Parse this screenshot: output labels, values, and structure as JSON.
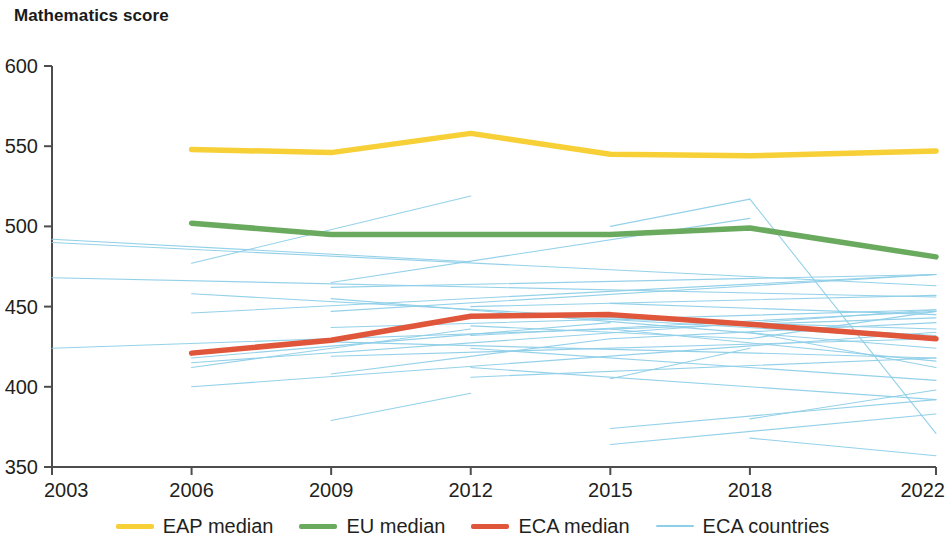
{
  "chart": {
    "title": "Mathematics score"
  },
  "legend": {
    "items": [
      {
        "label": "EAP median",
        "color": "#f7cf36",
        "width": "thick"
      },
      {
        "label": "EU median",
        "color": "#6aaa5f",
        "width": "thick"
      },
      {
        "label": "ECA median",
        "color": "#e0563a",
        "width": "thick"
      },
      {
        "label": "ECA countries",
        "color": "#8ecfe8",
        "width": "thin"
      }
    ]
  },
  "chart_data": {
    "type": "line",
    "title": "Mathematics score",
    "xlabel": "",
    "ylabel": "Mathematics score",
    "xlim": [
      2003,
      2022
    ],
    "ylim": [
      350,
      600
    ],
    "xticks": [
      2003,
      2006,
      2009,
      2012,
      2015,
      2018,
      2022
    ],
    "yticks": [
      350,
      400,
      450,
      500,
      550,
      600
    ],
    "grid": false,
    "legend_position": "bottom",
    "series": [
      {
        "name": "EAP median",
        "color": "#f7cf36",
        "x": [
          2006,
          2009,
          2012,
          2015,
          2018,
          2022
        ],
        "values": [
          548,
          546,
          558,
          545,
          544,
          547
        ]
      },
      {
        "name": "EU median",
        "color": "#6aaa5f",
        "x": [
          2006,
          2009,
          2012,
          2015,
          2018,
          2022
        ],
        "values": [
          502,
          495,
          495,
          495,
          499,
          481
        ]
      },
      {
        "name": "ECA median",
        "color": "#e0563a",
        "x": [
          2006,
          2009,
          2012,
          2015,
          2018,
          2022
        ],
        "values": [
          421,
          429,
          444,
          445,
          439,
          430
        ]
      }
    ],
    "background_series": {
      "name": "ECA countries",
      "color": "#8ecfe8",
      "lines": [
        {
          "x": [
            2003,
            2022
          ],
          "values": [
            490,
            463
          ]
        },
        {
          "x": [
            2003,
            2022
          ],
          "values": [
            468,
            456
          ]
        },
        {
          "x": [
            2003,
            2022
          ],
          "values": [
            424,
            443
          ]
        },
        {
          "x": [
            2006,
            2012
          ],
          "values": [
            477,
            519
          ]
        },
        {
          "x": [
            2006,
            2022
          ],
          "values": [
            446,
            470
          ]
        },
        {
          "x": [
            2006,
            2022
          ],
          "values": [
            415,
            448
          ]
        },
        {
          "x": [
            2006,
            2022
          ],
          "values": [
            400,
            434
          ]
        },
        {
          "x": [
            2009,
            2012
          ],
          "values": [
            379,
            396
          ]
        },
        {
          "x": [
            2009,
            2018
          ],
          "values": [
            465,
            505
          ]
        },
        {
          "x": [
            2009,
            2022
          ],
          "values": [
            455,
            424
          ]
        },
        {
          "x": [
            2009,
            2022
          ],
          "values": [
            437,
            448
          ]
        },
        {
          "x": [
            2009,
            2022
          ],
          "values": [
            428,
            418
          ]
        },
        {
          "x": [
            2009,
            2022
          ],
          "values": [
            419,
            430
          ]
        },
        {
          "x": [
            2012,
            2018
          ],
          "values": [
            438,
            430
          ]
        },
        {
          "x": [
            2012,
            2022
          ],
          "values": [
            432,
            447
          ]
        },
        {
          "x": [
            2012,
            2022
          ],
          "values": [
            424,
            404
          ]
        },
        {
          "x": [
            2012,
            2022
          ],
          "values": [
            412,
            392
          ]
        },
        {
          "x": [
            2015,
            2018
          ],
          "values": [
            405,
            424
          ]
        },
        {
          "x": [
            2015,
            2018
          ],
          "values": [
            500,
            517
          ]
        },
        {
          "x": [
            2015,
            2022
          ],
          "values": [
            442,
            430
          ]
        },
        {
          "x": [
            2015,
            2022
          ],
          "values": [
            436,
            416
          ]
        },
        {
          "x": [
            2015,
            2022
          ],
          "values": [
            430,
            440
          ]
        },
        {
          "x": [
            2015,
            2022
          ],
          "values": [
            374,
            392
          ]
        },
        {
          "x": [
            2015,
            2022
          ],
          "values": [
            364,
            383
          ]
        },
        {
          "x": [
            2018,
            2022
          ],
          "values": [
            517,
            371
          ]
        },
        {
          "x": [
            2018,
            2022
          ],
          "values": [
            434,
            412
          ]
        },
        {
          "x": [
            2018,
            2022
          ],
          "values": [
            430,
            447
          ]
        },
        {
          "x": [
            2018,
            2022
          ],
          "values": [
            368,
            357
          ]
        },
        {
          "x": [
            2018,
            2022
          ],
          "values": [
            380,
            398
          ]
        },
        {
          "x": [
            2006,
            2022
          ],
          "values": [
            458,
            432
          ]
        },
        {
          "x": [
            2009,
            2022
          ],
          "values": [
            447,
            470
          ]
        },
        {
          "x": [
            2012,
            2022
          ],
          "values": [
            450,
            457
          ]
        },
        {
          "x": [
            2009,
            2015
          ],
          "values": [
            408,
            430
          ]
        },
        {
          "x": [
            2006,
            2015
          ],
          "values": [
            418,
            440
          ]
        },
        {
          "x": [
            2006,
            2012
          ],
          "values": [
            412,
            436
          ]
        },
        {
          "x": [
            2012,
            2022
          ],
          "values": [
            445,
            436
          ]
        },
        {
          "x": [
            2015,
            2022
          ],
          "values": [
            452,
            445
          ]
        },
        {
          "x": [
            2003,
            2012
          ],
          "values": [
            492,
            478
          ]
        },
        {
          "x": [
            2009,
            2022
          ],
          "values": [
            462,
            470
          ]
        },
        {
          "x": [
            2012,
            2022
          ],
          "values": [
            406,
            418
          ]
        }
      ]
    }
  }
}
